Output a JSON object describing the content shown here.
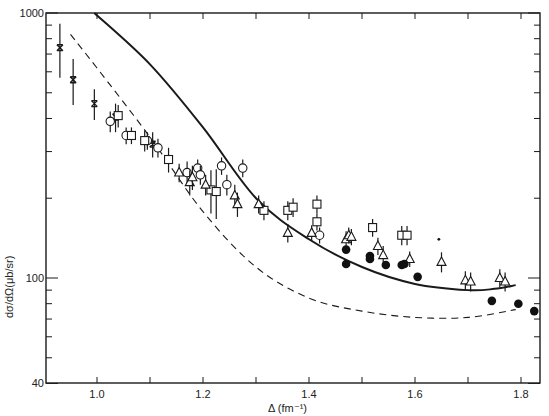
{
  "chart_data": {
    "type": "scatter",
    "title": "",
    "xlabel": "Δ (fm⁻¹)",
    "ylabel": "dσ/dΩ(μb/sr)",
    "xlim": [
      0.904,
      1.836
    ],
    "ylim": [
      40,
      1000
    ],
    "yscale": "log",
    "grid": false,
    "legend": "none",
    "x_ticks": [
      {
        "value": 1.0,
        "label": "1.0"
      },
      {
        "value": 1.1,
        "label": ""
      },
      {
        "value": 1.2,
        "label": "1.2"
      },
      {
        "value": 1.3,
        "label": ""
      },
      {
        "value": 1.4,
        "label": "1.4"
      },
      {
        "value": 1.5,
        "label": ""
      },
      {
        "value": 1.6,
        "label": "1.6"
      },
      {
        "value": 1.7,
        "label": ""
      },
      {
        "value": 1.8,
        "label": "1.8"
      }
    ],
    "y_ticks": [
      {
        "value": 1000,
        "label": "1000"
      },
      {
        "value": 100,
        "label": "100"
      },
      {
        "value": 40,
        "label": "40"
      }
    ],
    "y_minor_ticks": [
      900,
      800,
      700,
      600,
      500,
      400,
      300,
      200,
      90,
      80,
      70,
      60,
      50
    ],
    "series": [
      {
        "name": "crosses",
        "marker": "x",
        "points": [
          {
            "x": 0.93,
            "y": 740,
            "err": 170
          },
          {
            "x": 0.955,
            "y": 560,
            "err": 110
          },
          {
            "x": 0.995,
            "y": 455,
            "err": 60
          },
          {
            "x": 1.035,
            "y": 405,
            "err": 50
          },
          {
            "x": 1.105,
            "y": 320,
            "err": 35
          }
        ]
      },
      {
        "name": "open-circles",
        "marker": "o",
        "points": [
          {
            "x": 1.025,
            "y": 390,
            "err": 35
          },
          {
            "x": 1.055,
            "y": 345,
            "err": 25
          },
          {
            "x": 1.095,
            "y": 330,
            "err": 25
          },
          {
            "x": 1.115,
            "y": 310,
            "err": 25
          },
          {
            "x": 1.17,
            "y": 250,
            "err": 25
          },
          {
            "x": 1.19,
            "y": 260,
            "err": 20
          },
          {
            "x": 1.195,
            "y": 245,
            "err": 20
          },
          {
            "x": 1.235,
            "y": 265,
            "err": 20
          },
          {
            "x": 1.275,
            "y": 260,
            "err": 20
          },
          {
            "x": 1.245,
            "y": 225,
            "err": 20
          },
          {
            "x": 1.42,
            "y": 145,
            "err": 10
          }
        ]
      },
      {
        "name": "open-squares",
        "marker": "s",
        "points": [
          {
            "x": 1.04,
            "y": 410,
            "err": 40
          },
          {
            "x": 1.065,
            "y": 345,
            "err": 25
          },
          {
            "x": 1.09,
            "y": 330,
            "err": 30
          },
          {
            "x": 1.135,
            "y": 280,
            "err": 30
          },
          {
            "x": 1.215,
            "y": 215,
            "err": 40
          },
          {
            "x": 1.225,
            "y": 212,
            "err": 45
          },
          {
            "x": 1.315,
            "y": 180,
            "err": 15
          },
          {
            "x": 1.36,
            "y": 180,
            "err": 15
          },
          {
            "x": 1.37,
            "y": 185,
            "err": 15
          },
          {
            "x": 1.415,
            "y": 190,
            "err": 15
          },
          {
            "x": 1.415,
            "y": 163,
            "err": 12
          },
          {
            "x": 1.52,
            "y": 155,
            "err": 12
          },
          {
            "x": 1.575,
            "y": 145,
            "err": 12
          },
          {
            "x": 1.585,
            "y": 145,
            "err": 12
          }
        ]
      },
      {
        "name": "open-triangles",
        "marker": "^",
        "points": [
          {
            "x": 1.155,
            "y": 250,
            "err": 20
          },
          {
            "x": 1.175,
            "y": 230,
            "err": 25
          },
          {
            "x": 1.18,
            "y": 240,
            "err": 25
          },
          {
            "x": 1.205,
            "y": 225,
            "err": 20
          },
          {
            "x": 1.26,
            "y": 205,
            "err": 20
          },
          {
            "x": 1.265,
            "y": 190,
            "err": 20
          },
          {
            "x": 1.305,
            "y": 190,
            "err": 15
          },
          {
            "x": 1.36,
            "y": 148,
            "err": 12
          },
          {
            "x": 1.405,
            "y": 148,
            "err": 10
          },
          {
            "x": 1.47,
            "y": 140,
            "err": 10
          },
          {
            "x": 1.475,
            "y": 145,
            "err": 10
          },
          {
            "x": 1.48,
            "y": 143,
            "err": 10
          },
          {
            "x": 1.53,
            "y": 132,
            "err": 10
          },
          {
            "x": 1.54,
            "y": 122,
            "err": 10
          },
          {
            "x": 1.59,
            "y": 118,
            "err": 8
          },
          {
            "x": 1.65,
            "y": 115,
            "err": 10
          },
          {
            "x": 1.695,
            "y": 98,
            "err": 8
          },
          {
            "x": 1.705,
            "y": 97,
            "err": 8
          },
          {
            "x": 1.76,
            "y": 100,
            "err": 8
          },
          {
            "x": 1.77,
            "y": 97,
            "err": 8
          }
        ]
      },
      {
        "name": "filled-circles",
        "marker": "filled-o",
        "points": [
          {
            "x": 1.47,
            "y": 128
          },
          {
            "x": 1.47,
            "y": 113
          },
          {
            "x": 1.515,
            "y": 121
          },
          {
            "x": 1.515,
            "y": 118
          },
          {
            "x": 1.545,
            "y": 112
          },
          {
            "x": 1.575,
            "y": 112
          },
          {
            "x": 1.58,
            "y": 113
          },
          {
            "x": 1.605,
            "y": 101
          },
          {
            "x": 1.745,
            "y": 82
          },
          {
            "x": 1.795,
            "y": 80
          },
          {
            "x": 1.825,
            "y": 75
          }
        ]
      },
      {
        "name": "solid-curve",
        "line": "solid",
        "points": [
          {
            "x": 0.995,
            "y": 1000
          },
          {
            "x": 1.1,
            "y": 640
          },
          {
            "x": 1.2,
            "y": 370
          },
          {
            "x": 1.3,
            "y": 200
          },
          {
            "x": 1.4,
            "y": 140
          },
          {
            "x": 1.5,
            "y": 110
          },
          {
            "x": 1.6,
            "y": 95
          },
          {
            "x": 1.7,
            "y": 90
          },
          {
            "x": 1.75,
            "y": 91
          },
          {
            "x": 1.79,
            "y": 94
          }
        ]
      },
      {
        "name": "dashed-curve",
        "line": "dashed",
        "points": [
          {
            "x": 0.95,
            "y": 830
          },
          {
            "x": 1.0,
            "y": 620
          },
          {
            "x": 1.1,
            "y": 340
          },
          {
            "x": 1.2,
            "y": 178
          },
          {
            "x": 1.3,
            "y": 110
          },
          {
            "x": 1.4,
            "y": 84
          },
          {
            "x": 1.5,
            "y": 75
          },
          {
            "x": 1.6,
            "y": 71
          },
          {
            "x": 1.7,
            "y": 71
          },
          {
            "x": 1.79,
            "y": 76
          }
        ]
      }
    ],
    "annotations": [
      {
        "text": "•",
        "x": 1.645,
        "y": 140
      }
    ]
  }
}
